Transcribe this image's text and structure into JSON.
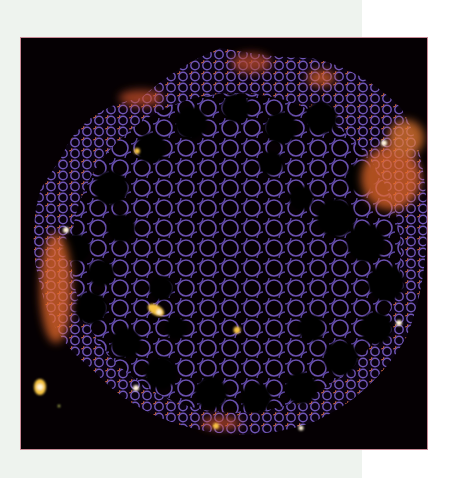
{
  "figure": {
    "kind": "fluorescence micrograph",
    "colormap": "inferno-like (black, purple, orange, yellow)",
    "colors": {
      "background_left": "#eef3ee",
      "background_right": "#ffffff",
      "panel": "#050003",
      "panel_border": "#c98a96",
      "cell_wall": "#6a50b0",
      "cell_wall_light": "#8a6fd0",
      "highlight_orange": "#e86a2a",
      "highlight_yellow": "#f6c443",
      "highlight_white": "#fff4d8"
    },
    "panel_bounds": {
      "x": 21,
      "y": 38,
      "width": 406,
      "height": 411
    }
  }
}
